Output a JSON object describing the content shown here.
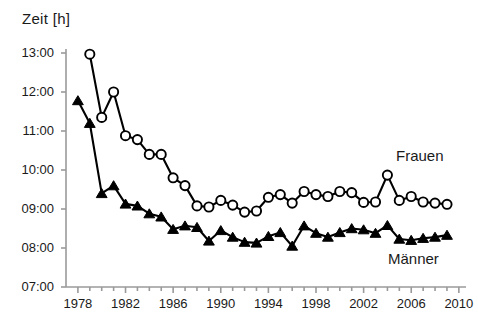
{
  "chart_data": {
    "type": "line",
    "title": "Zeit [h]",
    "xlabel": "",
    "ylabel": "Zeit [h]",
    "grid": false,
    "legend_position": "inline-right",
    "xlim": [
      1977.0,
      2010.6
    ],
    "ylim": [
      "07:00",
      "13:00"
    ],
    "ytick_labels": [
      "13:00",
      "12:00",
      "11:00",
      "10:00",
      "09:00",
      "08:00",
      "07:00"
    ],
    "ytick_values": [
      13.0,
      12.0,
      11.0,
      10.0,
      9.0,
      8.0,
      7.0
    ],
    "xtick_labels": [
      "1978",
      "1982",
      "1986",
      "1990",
      "1994",
      "1998",
      "2002",
      "2006",
      "2010"
    ],
    "xtick_values": [
      1978,
      1982,
      1986,
      1990,
      1994,
      1998,
      2002,
      2006,
      2010
    ],
    "x_minor_step": 1,
    "series": [
      {
        "name": "Frauen",
        "marker": "open-circle",
        "color": "#000000",
        "x": [
          1979,
          1980,
          1981,
          1982,
          1983,
          1984,
          1985,
          1986,
          1987,
          1988,
          1989,
          1990,
          1991,
          1992,
          1993,
          1994,
          1995,
          1996,
          1997,
          1998,
          1999,
          2000,
          2001,
          2002,
          2003,
          2004,
          2005,
          2006,
          2007,
          2008,
          2009
        ],
        "values": [
          12.97,
          11.35,
          12.0,
          10.88,
          10.78,
          10.4,
          10.4,
          9.8,
          9.6,
          9.08,
          9.05,
          9.22,
          9.1,
          8.92,
          8.95,
          9.3,
          9.37,
          9.15,
          9.45,
          9.37,
          9.32,
          9.45,
          9.42,
          9.17,
          9.18,
          9.87,
          9.22,
          9.32,
          9.18,
          9.15,
          9.12
        ],
        "value_labels": [
          "12:58",
          "11:21",
          "12:00",
          "10:53",
          "10:47",
          "10:24",
          "10:24",
          "09:48",
          "09:36",
          "09:05",
          "09:03",
          "09:13",
          "09:06",
          "08:55",
          "08:57",
          "09:18",
          "09:22",
          "09:09",
          "09:27",
          "09:22",
          "09:19",
          "09:27",
          "09:25",
          "09:10",
          "09:11",
          "09:52",
          "09:13",
          "09:19",
          "09:11",
          "09:09",
          "09:07"
        ]
      },
      {
        "name": "Männer",
        "marker": "filled-triangle",
        "color": "#000000",
        "x": [
          1978,
          1979,
          1980,
          1981,
          1982,
          1983,
          1984,
          1985,
          1986,
          1987,
          1988,
          1989,
          1990,
          1991,
          1992,
          1993,
          1994,
          1995,
          1996,
          1997,
          1998,
          1999,
          2000,
          2001,
          2002,
          2003,
          2004,
          2005,
          2006,
          2007,
          2008,
          2009
        ],
        "values": [
          11.78,
          11.2,
          9.4,
          9.6,
          9.13,
          9.08,
          8.88,
          8.8,
          8.48,
          8.57,
          8.53,
          8.18,
          8.45,
          8.28,
          8.15,
          8.13,
          8.3,
          8.4,
          8.05,
          8.57,
          8.38,
          8.28,
          8.4,
          8.5,
          8.47,
          8.38,
          8.58,
          8.23,
          8.2,
          8.25,
          8.28,
          8.33
        ],
        "value_labels": [
          "11:47",
          "11:12",
          "09:24",
          "09:36",
          "09:08",
          "09:05",
          "08:53",
          "08:48",
          "08:29",
          "08:34",
          "08:32",
          "08:11",
          "08:27",
          "08:17",
          "08:09",
          "08:08",
          "08:18",
          "08:24",
          "08:03",
          "08:34",
          "08:23",
          "08:17",
          "08:24",
          "08:30",
          "08:28",
          "08:23",
          "08:35",
          "08:14",
          "08:12",
          "08:15",
          "08:17",
          "08:20"
        ]
      }
    ]
  },
  "labels": {
    "frauen": "Frauen",
    "maenner": "Männer"
  }
}
